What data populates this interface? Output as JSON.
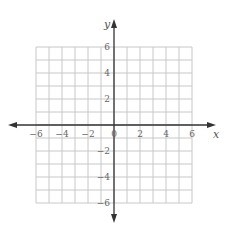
{
  "chart_data": {
    "type": "scatter",
    "title": "",
    "xlabel": "x",
    "ylabel": "y",
    "xlim": [
      -6,
      6
    ],
    "ylim": [
      -6,
      6
    ],
    "grid": true,
    "grid_step": 1,
    "x_ticks": [
      -6,
      -4,
      -2,
      0,
      2,
      4,
      6
    ],
    "y_ticks": [
      -6,
      -4,
      -2,
      2,
      4,
      6
    ],
    "x_tick_labels": [
      "−6",
      "−4",
      "−2",
      "0",
      "2",
      "4",
      "6"
    ],
    "y_tick_labels": [
      "−6",
      "−4",
      "−2",
      "2",
      "4",
      "6"
    ],
    "series": [],
    "axes_arrows": true
  },
  "colors": {
    "grid": "#c8c8c8",
    "axis": "#333333",
    "label": "#666666"
  }
}
